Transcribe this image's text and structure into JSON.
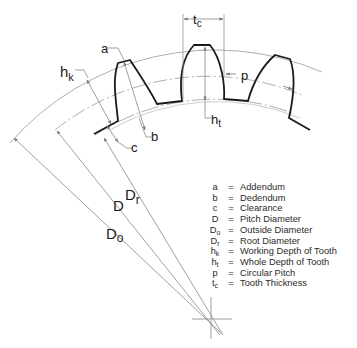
{
  "diagram": {
    "labels": {
      "a": "a",
      "b": "b",
      "c": "c",
      "hk": "h",
      "hk_sub": "k",
      "ht": "h",
      "ht_sub": "t",
      "p": "p",
      "tc": "t",
      "tc_sub": "c",
      "Dr": "D",
      "Dr_sub": "r",
      "D": "D",
      "Do": "D",
      "Do_sub": "o"
    },
    "legend": [
      {
        "symbol": "a",
        "sub": "",
        "eq": "=",
        "meaning": "Addendum"
      },
      {
        "symbol": "b",
        "sub": "",
        "eq": "=",
        "meaning": "Dedendum"
      },
      {
        "symbol": "c",
        "sub": "",
        "eq": "=",
        "meaning": "Clearance"
      },
      {
        "symbol": "D",
        "sub": "",
        "eq": "=",
        "meaning": "Pitch Diameter"
      },
      {
        "symbol": "D",
        "sub": "o",
        "eq": "=",
        "meaning": "Outside Diameter"
      },
      {
        "symbol": "D",
        "sub": "r",
        "eq": "=",
        "meaning": "Root Diameter"
      },
      {
        "symbol": "h",
        "sub": "k",
        "eq": "=",
        "meaning": "Working Depth of Tooth"
      },
      {
        "symbol": "h",
        "sub": "t",
        "eq": "=",
        "meaning": "Whole Depth of Tooth"
      },
      {
        "symbol": "p",
        "sub": "",
        "eq": "=",
        "meaning": "Circular Pitch"
      },
      {
        "symbol": "t",
        "sub": "c",
        "eq": "=",
        "meaning": "Tooth Thickness"
      }
    ],
    "colors": {
      "tooth_outline": "#1a1a1a",
      "construction_line": "#8a8a8a",
      "text": "#1a1a1a"
    }
  }
}
